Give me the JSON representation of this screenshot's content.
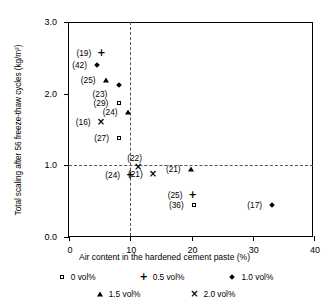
{
  "chart_data": {
    "type": "scatter",
    "title": "",
    "xlabel": "Air content in the hardened cement paste (%)",
    "ylabel": "Total scaling after 56 freeze-thaw cycles (kg/m²)",
    "xlim": [
      0,
      40
    ],
    "ylim": [
      0.0,
      3.0
    ],
    "xticks": [
      "0",
      "10",
      "20",
      "30",
      "40"
    ],
    "xtick_values": [
      0,
      10,
      20,
      30,
      40
    ],
    "yticks": [
      "0.0",
      "1.0",
      "2.0",
      "3.0"
    ],
    "ytick_values": [
      0.0,
      1.0,
      2.0,
      3.0
    ],
    "grid": false,
    "reference_lines": {
      "vertical_x": 10,
      "horizontal_y": 1.0
    },
    "legend_position": "below-axis",
    "legend": [
      {
        "marker": "square",
        "label": "0 vol%"
      },
      {
        "marker": "plus",
        "label": "0.5 vol%"
      },
      {
        "marker": "diamond",
        "label": "1.0 vol%"
      },
      {
        "marker": "triangle",
        "label": "1.5 vol%"
      },
      {
        "marker": "ex",
        "label": "2.0 vol%"
      }
    ],
    "series": [
      {
        "name": "0 vol%",
        "marker": "square",
        "points": [
          {
            "label": "(29)",
            "x": 8.1,
            "y": 1.87,
            "label_pos": "left"
          },
          {
            "label": "(27)",
            "x": 8.2,
            "y": 1.38,
            "label_pos": "left"
          },
          {
            "label": "(36)",
            "x": 20.4,
            "y": 0.44,
            "label_pos": "left"
          }
        ]
      },
      {
        "name": "0.5 vol%",
        "marker": "plus",
        "points": [
          {
            "label": "(19)",
            "x": 5.3,
            "y": 2.57,
            "label_pos": "left"
          },
          {
            "label": "(24)",
            "x": 10.0,
            "y": 0.86,
            "label_pos": "left"
          },
          {
            "label": "(25)",
            "x": 20.2,
            "y": 0.59,
            "label_pos": "left"
          }
        ]
      },
      {
        "name": "1.0 vol%",
        "marker": "diamond",
        "points": [
          {
            "label": "(42)",
            "x": 4.6,
            "y": 2.4,
            "label_pos": "left"
          },
          {
            "label": "(23)",
            "x": 8.1,
            "y": 2.12,
            "label_pos": "below-left"
          },
          {
            "label": "(17)",
            "x": 33.2,
            "y": 0.44,
            "label_pos": "left"
          }
        ]
      },
      {
        "name": "1.5 vol%",
        "marker": "triangle",
        "points": [
          {
            "label": "(25)",
            "x": 6.0,
            "y": 2.19,
            "label_pos": "left"
          },
          {
            "label": "(24)",
            "x": 9.6,
            "y": 1.74,
            "label_pos": "left"
          },
          {
            "label": "(21)",
            "x": 19.9,
            "y": 0.95,
            "label_pos": "left"
          }
        ]
      },
      {
        "name": "2.0 vol%",
        "marker": "ex",
        "points": [
          {
            "label": "(16)",
            "x": 5.2,
            "y": 1.6,
            "label_pos": "left"
          },
          {
            "label": "(22)",
            "x": 11.3,
            "y": 0.97,
            "label_pos": "above"
          },
          {
            "label": "(21)",
            "x": 13.7,
            "y": 0.88,
            "label_pos": "left"
          }
        ]
      }
    ]
  }
}
